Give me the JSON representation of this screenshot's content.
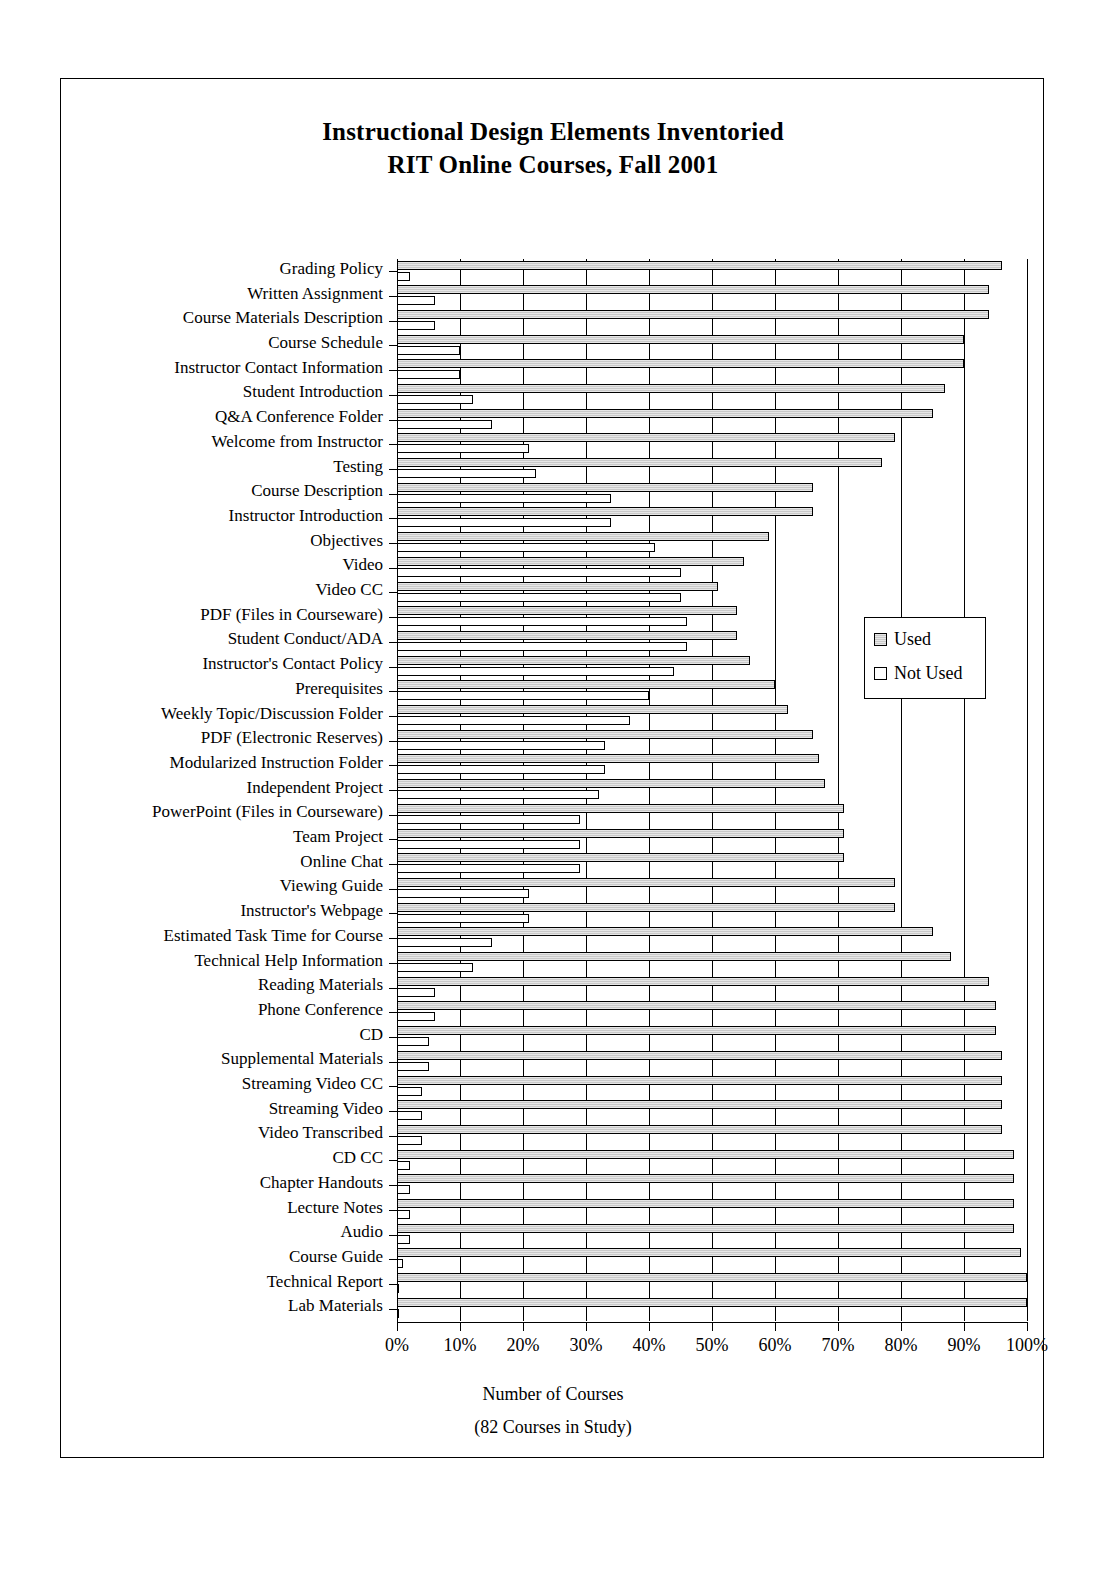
{
  "title": {
    "line1": "Instructional Design Elements Inventoried",
    "line2": "RIT Online Courses, Fall 2001"
  },
  "axis": {
    "x_title_line1": "Number of Courses",
    "x_title_line2": "(82 Courses in Study)"
  },
  "legend": {
    "used": "Used",
    "not_used": "Not Used"
  },
  "chart_data": {
    "type": "bar",
    "orientation": "horizontal",
    "xlabel": "Number of Courses (82 Courses in Study)",
    "ylabel": "",
    "xlim": [
      0,
      100
    ],
    "xticks": [
      "0%",
      "10%",
      "20%",
      "30%",
      "40%",
      "50%",
      "60%",
      "70%",
      "80%",
      "90%",
      "100%"
    ],
    "grid": true,
    "legend_position": "right",
    "units": "percent of 82 courses",
    "categories": [
      "Grading Policy",
      "Written Assignment",
      "Course Materials Description",
      "Course Schedule",
      "Instructor Contact Information",
      "Student Introduction",
      "Q&A Conference Folder",
      "Welcome from Instructor",
      "Testing",
      "Course Description",
      "Instructor Introduction",
      "Objectives",
      "Video",
      "Video CC",
      "PDF (Files in Courseware)",
      "Student Conduct/ADA",
      "Instructor's Contact Policy",
      "Prerequisites",
      "Weekly Topic/Discussion Folder",
      "PDF (Electronic Reserves)",
      "Modularized Instruction Folder",
      "Independent Project",
      "PowerPoint (Files in Courseware)",
      "Team Project",
      "Online Chat",
      "Viewing Guide",
      "Instructor's Webpage",
      "Estimated Task Time for Course",
      "Technical Help Information",
      "Reading Materials",
      "Phone Conference",
      "CD",
      "Supplemental Materials",
      "Streaming Video CC",
      "Streaming Video",
      "Video Transcribed",
      "CD CC",
      "Chapter Handouts",
      "Lecture Notes",
      "Audio",
      "Course Guide",
      "Technical Report",
      "Lab Materials"
    ],
    "series": [
      {
        "name": "Used",
        "values": [
          96,
          94,
          94,
          90,
          90,
          87,
          85,
          79,
          77,
          66,
          66,
          59,
          55,
          51,
          54,
          54,
          56,
          60,
          62,
          66,
          67,
          68,
          71,
          71,
          71,
          79,
          79,
          85,
          88,
          94,
          95,
          95,
          96,
          96,
          96,
          96,
          98,
          98,
          98,
          98,
          99,
          100,
          100
        ]
      },
      {
        "name": "Not Used",
        "values": [
          2,
          6,
          6,
          10,
          10,
          12,
          15,
          21,
          22,
          34,
          34,
          41,
          45,
          45,
          46,
          46,
          44,
          40,
          37,
          33,
          33,
          32,
          29,
          29,
          29,
          21,
          21,
          15,
          12,
          6,
          6,
          5,
          5,
          4,
          4,
          4,
          2,
          2,
          2,
          2,
          1,
          0,
          0
        ]
      }
    ]
  }
}
